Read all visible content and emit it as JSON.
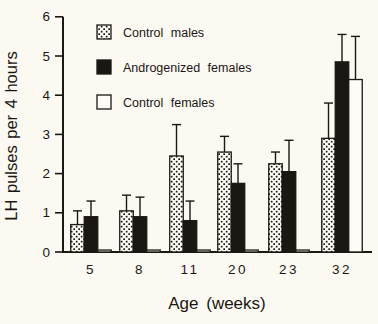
{
  "chart_data": {
    "type": "bar",
    "title": "",
    "xlabel": "Age (weeks)",
    "ylabel": "LH pulses per 4 hours",
    "categories": [
      "5",
      "8",
      "11",
      "20",
      "23",
      "32"
    ],
    "ylim": [
      0,
      6
    ],
    "yticks": [
      0,
      1,
      2,
      3,
      4,
      5,
      6
    ],
    "grid": false,
    "error_bars": "upper error bars with caps",
    "legend_position": "inside top-left",
    "series": [
      {
        "name": "Control males",
        "pattern": "stippled",
        "values": [
          0.7,
          1.05,
          2.45,
          2.55,
          2.25,
          2.9
        ],
        "error_up": [
          0.35,
          0.4,
          0.8,
          0.4,
          0.3,
          0.9
        ]
      },
      {
        "name": "Androgenized females",
        "pattern": "solid-black",
        "values": [
          0.9,
          0.9,
          0.8,
          1.75,
          2.05,
          4.85
        ],
        "error_up": [
          0.4,
          0.5,
          0.5,
          0.5,
          0.8,
          0.7
        ]
      },
      {
        "name": "Control females",
        "pattern": "open-white",
        "values": [
          0.05,
          0.05,
          0.05,
          0.05,
          0.05,
          4.4
        ],
        "error_up": [
          0,
          0,
          0,
          0,
          0,
          1.1
        ]
      }
    ],
    "colors": {
      "ink": "#1b1713",
      "background": "#fbf9f2",
      "bar_white_fill": "#fdfcf7"
    }
  }
}
